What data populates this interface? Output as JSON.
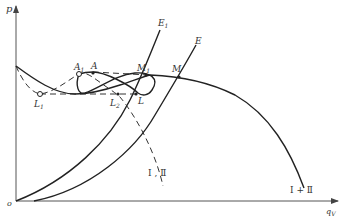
{
  "diagram": {
    "type": "pump-characteristic-curves",
    "axes": {
      "y_label": "p",
      "x_label": "q",
      "x_label_sub": "V",
      "origin_label": "o"
    },
    "curves": [
      {
        "id": "combined",
        "label": "Ⅰ + Ⅱ",
        "style": "solid"
      },
      {
        "id": "single",
        "label": "Ⅰ , Ⅱ",
        "style": "dashed"
      },
      {
        "id": "E1",
        "label": "E",
        "label_sub": "1",
        "style": "solid"
      },
      {
        "id": "E",
        "label": "E",
        "style": "solid"
      }
    ],
    "points": [
      {
        "id": "A1",
        "label": "A",
        "sub": "1",
        "marker": "open"
      },
      {
        "id": "A",
        "label": "A",
        "sub": "",
        "marker": "filled"
      },
      {
        "id": "M1",
        "label": "M",
        "sub": "1",
        "marker": "filled"
      },
      {
        "id": "M",
        "label": "M",
        "sub": "",
        "marker": "filled"
      },
      {
        "id": "L",
        "label": "L",
        "sub": "",
        "marker": "filled"
      },
      {
        "id": "L1",
        "label": "L",
        "sub": "1",
        "marker": "open"
      },
      {
        "id": "L2",
        "label": "L",
        "sub": "2",
        "marker": "filled"
      }
    ]
  }
}
